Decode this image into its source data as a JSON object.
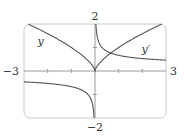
{
  "chart_data": {
    "type": "line",
    "title": "",
    "xlabel": "",
    "ylabel": "",
    "xlim": [
      -3,
      3
    ],
    "ylim": [
      -2,
      2
    ],
    "grid": false,
    "x_tick_labels": [
      {
        "value": -3,
        "label": "−3"
      },
      {
        "value": 3,
        "label": "3"
      }
    ],
    "y_tick_labels": [
      {
        "value": 2,
        "label": "2"
      },
      {
        "value": -2,
        "label": "−2"
      }
    ],
    "x_ticks": [
      -2,
      -1,
      1,
      2
    ],
    "y_ticks": [
      -1,
      1
    ],
    "series": [
      {
        "name": "y",
        "label": "y",
        "description": "cusp curve, y = x^(2/3)",
        "x": [
          -3,
          -2.5,
          -2,
          -1.5,
          -1,
          -0.5,
          -0.25,
          -0.1,
          0,
          0.1,
          0.25,
          0.5,
          1,
          1.5,
          2,
          2.5,
          2.83
        ],
        "y": [
          2.08,
          1.84,
          1.59,
          1.31,
          1.0,
          0.63,
          0.4,
          0.22,
          0,
          0.22,
          0.4,
          0.63,
          1.0,
          1.31,
          1.59,
          1.84,
          2.0
        ],
        "label_pos": {
          "x": -2.3,
          "y": 1.3
        }
      },
      {
        "name": "y_prime",
        "label": "y′",
        "description": "derivative, y′ = (2/3)x^(-1/3), vertical asymptote at x=0",
        "x": [
          -3,
          -2.5,
          -2,
          -1.5,
          -1,
          -0.5,
          -0.25,
          -0.1,
          -0.037,
          0.037,
          0.1,
          0.25,
          0.5,
          1,
          1.5,
          2,
          2.5,
          3
        ],
        "y": [
          -0.46,
          -0.49,
          -0.53,
          -0.58,
          -0.67,
          -0.84,
          -1.06,
          -1.44,
          -2.0,
          2.0,
          1.44,
          1.06,
          0.84,
          0.67,
          0.58,
          0.53,
          0.49,
          0.46
        ],
        "label_pos": {
          "x": 2.15,
          "y": 0.95
        }
      }
    ],
    "colors": {
      "curve": "#555555",
      "axis": "#9a9a9a",
      "frame": "#c8c8c8",
      "text": "#333333"
    }
  }
}
